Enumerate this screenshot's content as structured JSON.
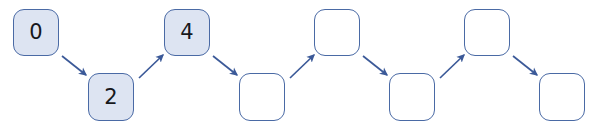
{
  "diagram": {
    "background_color": "#ffffff",
    "node_fill_color": "#dde4f2",
    "node_border_color": "#4a6aa5",
    "node_empty_fill_color": "#ffffff",
    "label_color": "#17181c",
    "arrow_color": "#3b5998",
    "nodes": [
      {
        "id": "node-1",
        "label": "0",
        "filled": true,
        "row": "top",
        "x": 13,
        "y": 9,
        "w": 46,
        "h": 47
      },
      {
        "id": "node-2",
        "label": "2",
        "filled": true,
        "row": "bottom",
        "x": 88,
        "y": 73,
        "w": 46,
        "h": 48
      },
      {
        "id": "node-3",
        "label": "4",
        "filled": true,
        "row": "top",
        "x": 164,
        "y": 9,
        "w": 46,
        "h": 47
      },
      {
        "id": "node-4",
        "label": "",
        "filled": false,
        "row": "bottom",
        "x": 239,
        "y": 73,
        "w": 46,
        "h": 48
      },
      {
        "id": "node-5",
        "label": "",
        "filled": false,
        "row": "top",
        "x": 314,
        "y": 9,
        "w": 46,
        "h": 47
      },
      {
        "id": "node-6",
        "label": "",
        "filled": false,
        "row": "bottom",
        "x": 389,
        "y": 73,
        "w": 46,
        "h": 48
      },
      {
        "id": "node-7",
        "label": "",
        "filled": false,
        "row": "top",
        "x": 464,
        "y": 9,
        "w": 46,
        "h": 47
      },
      {
        "id": "node-8",
        "label": "",
        "filled": false,
        "row": "bottom",
        "x": 539,
        "y": 73,
        "w": 46,
        "h": 48
      }
    ],
    "arrows": [
      {
        "id": "arrow-1",
        "from": "node-1",
        "to": "node-2",
        "direction": "down-right",
        "x1": 62,
        "y1": 56,
        "x2": 86,
        "y2": 75
      },
      {
        "id": "arrow-2",
        "from": "node-2",
        "to": "node-3",
        "direction": "up-right",
        "x1": 139,
        "y1": 78,
        "x2": 163,
        "y2": 55
      },
      {
        "id": "arrow-3",
        "from": "node-3",
        "to": "node-4",
        "direction": "down-right",
        "x1": 213,
        "y1": 56,
        "x2": 237,
        "y2": 75
      },
      {
        "id": "arrow-4",
        "from": "node-4",
        "to": "node-5",
        "direction": "up-right",
        "x1": 290,
        "y1": 78,
        "x2": 314,
        "y2": 55
      },
      {
        "id": "arrow-5",
        "from": "node-5",
        "to": "node-6",
        "direction": "down-right",
        "x1": 363,
        "y1": 56,
        "x2": 387,
        "y2": 75
      },
      {
        "id": "arrow-6",
        "from": "node-6",
        "to": "node-7",
        "direction": "up-right",
        "x1": 440,
        "y1": 78,
        "x2": 464,
        "y2": 55
      },
      {
        "id": "arrow-7",
        "from": "node-7",
        "to": "node-8",
        "direction": "down-right",
        "x1": 513,
        "y1": 56,
        "x2": 537,
        "y2": 75
      }
    ]
  }
}
